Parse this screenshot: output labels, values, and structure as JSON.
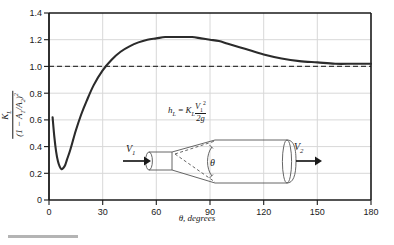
{
  "chart_data": {
    "type": "line",
    "title": "",
    "xlabel": "θ, degrees",
    "ylabel": "K_L / (1 - A_1/A_2)^2",
    "xlim": [
      0,
      180
    ],
    "ylim": [
      0,
      1.4
    ],
    "xticks": [
      "0",
      "30",
      "60",
      "90",
      "120",
      "150",
      "180"
    ],
    "yticks": [
      "0",
      "0.2",
      "0.4",
      "0.6",
      "0.8",
      "1.0",
      "1.2",
      "1.4"
    ],
    "grid": true,
    "legend": "none",
    "reference_line": {
      "label": "1.0",
      "value": 1.0,
      "style": "dashed"
    },
    "series": [
      {
        "name": "Diffuser loss coefficient",
        "x": [
          2,
          3,
          4,
          5,
          6,
          7,
          8,
          9,
          10,
          12,
          15,
          18,
          21,
          25,
          30,
          35,
          40,
          45,
          50,
          55,
          60,
          65,
          70,
          75,
          80,
          85,
          90,
          95,
          100,
          110,
          120,
          130,
          140,
          150,
          160,
          170,
          180
        ],
        "values": [
          0.62,
          0.47,
          0.36,
          0.29,
          0.25,
          0.23,
          0.24,
          0.26,
          0.3,
          0.38,
          0.52,
          0.64,
          0.74,
          0.86,
          0.97,
          1.05,
          1.11,
          1.15,
          1.18,
          1.2,
          1.21,
          1.22,
          1.22,
          1.22,
          1.22,
          1.21,
          1.2,
          1.19,
          1.17,
          1.13,
          1.09,
          1.06,
          1.04,
          1.03,
          1.02,
          1.02,
          1.02
        ]
      }
    ],
    "annotations": {
      "equation_hl": "h",
      "equation_hl_sub": "L",
      "equation_eq": "=",
      "equation_kl": "K",
      "equation_kl_sub": "L",
      "equation_num": "V",
      "equation_num_sub": "1",
      "equation_num_sup": "2",
      "equation_den": "2g",
      "area_ratio_num": "A",
      "area_ratio_num_sub": "2",
      "area_ratio_den": "A",
      "area_ratio_den_sub": "1",
      "area_ratio_note": "fixed",
      "inlet_velocity": "V",
      "inlet_velocity_sub": "1",
      "outlet_velocity": "V",
      "outlet_velocity_sub": "2",
      "angle_symbol": "θ"
    },
    "ylabel_parts": {
      "numerator": "K",
      "numerator_sub": "L",
      "denominator_open": "(1 − A",
      "denominator_sub1": "1",
      "denominator_mid": "/A",
      "denominator_sub2": "2",
      "denominator_close": ")",
      "denominator_sup": "2"
    }
  },
  "colors": {
    "curve": "#2b2b2b",
    "grid": "#d8d8d8",
    "axis": "#1a1a1a",
    "dashed": "#3a3a3a",
    "diagram": "#555555",
    "caption_rule": "#b4b4b4",
    "background": "#ffffff"
  }
}
